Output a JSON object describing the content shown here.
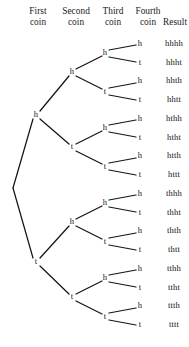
{
  "figure": {
    "background_color": "#ffffff",
    "line_color": "#151515",
    "text_color": "#141414"
  },
  "headers": [
    {
      "id": "first-coin",
      "line1": "First",
      "line2": "coin",
      "x": 38,
      "y": 6
    },
    {
      "id": "second-coin",
      "line1": "Second",
      "line2": "coin",
      "x": 76,
      "y": 6
    },
    {
      "id": "third-coin",
      "line1": "Third",
      "line2": "coin",
      "x": 113,
      "y": 6
    },
    {
      "id": "fourth-coin",
      "line1": "Fourth",
      "line2": "coin",
      "x": 148,
      "y": 6
    },
    {
      "id": "result",
      "line1": "",
      "line2": "Result",
      "x": 175,
      "y": 6
    }
  ],
  "tree": {
    "root": {
      "x": 13,
      "y": 188
    },
    "columns": {
      "first_coin_x": 36,
      "second_coin_x": 72,
      "third_coin_x": 105,
      "fourth_coin_x": 140,
      "result_x": 174
    },
    "leaf_start_y": 44,
    "leaf_spacing": 18.75,
    "nodes": [
      {
        "id": "n-h",
        "label": "h",
        "level": 1,
        "x": 36,
        "y": 115.25
      },
      {
        "id": "n-t",
        "label": "t",
        "level": 1,
        "x": 36,
        "y": 261.75
      },
      {
        "id": "n-hh",
        "label": "h",
        "level": 2,
        "x": 72,
        "y": 72.5
      },
      {
        "id": "n-ht",
        "label": "t",
        "level": 2,
        "x": 72,
        "y": 147.5
      },
      {
        "id": "n-th",
        "label": "h",
        "level": 2,
        "x": 72,
        "y": 222.5
      },
      {
        "id": "n-tt",
        "label": "t",
        "level": 2,
        "x": 72,
        "y": 297.5
      },
      {
        "id": "n-hhh",
        "label": "h",
        "level": 3,
        "x": 105,
        "y": 53.4
      },
      {
        "id": "n-hht",
        "label": "t",
        "level": 3,
        "x": 105,
        "y": 91.6
      },
      {
        "id": "n-hth",
        "label": "h",
        "level": 3,
        "x": 105,
        "y": 128.4
      },
      {
        "id": "n-htt",
        "label": "t",
        "level": 3,
        "x": 105,
        "y": 166.6
      },
      {
        "id": "n-thh",
        "label": "h",
        "level": 3,
        "x": 105,
        "y": 203.4
      },
      {
        "id": "n-tht",
        "label": "t",
        "level": 3,
        "x": 105,
        "y": 241.6
      },
      {
        "id": "n-tth",
        "label": "h",
        "level": 3,
        "x": 105,
        "y": 278.4
      },
      {
        "id": "n-ttt",
        "label": "t",
        "level": 3,
        "x": 105,
        "y": 316.6
      }
    ],
    "leaves": [
      {
        "id": "leaf-hhhh",
        "label": "h",
        "result": "hhhh",
        "x": 140,
        "y": 44.0
      },
      {
        "id": "leaf-hhht",
        "label": "t",
        "result": "hhht",
        "x": 140,
        "y": 62.8
      },
      {
        "id": "leaf-hhth",
        "label": "h",
        "result": "hhth",
        "x": 140,
        "y": 81.5
      },
      {
        "id": "leaf-hhtt",
        "label": "t",
        "result": "hhtt",
        "x": 140,
        "y": 100.3
      },
      {
        "id": "leaf-hthh",
        "label": "h",
        "result": "hthh",
        "x": 140,
        "y": 119.0
      },
      {
        "id": "leaf-htht",
        "label": "t",
        "result": "htht",
        "x": 140,
        "y": 137.8
      },
      {
        "id": "leaf-htth",
        "label": "h",
        "result": "htth",
        "x": 140,
        "y": 156.5
      },
      {
        "id": "leaf-httt",
        "label": "t",
        "result": "httt",
        "x": 140,
        "y": 175.3
      },
      {
        "id": "leaf-thhh",
        "label": "h",
        "result": "thhh",
        "x": 140,
        "y": 194.0
      },
      {
        "id": "leaf-thht",
        "label": "t",
        "result": "thht",
        "x": 140,
        "y": 212.8
      },
      {
        "id": "leaf-thth",
        "label": "h",
        "result": "thth",
        "x": 140,
        "y": 231.5
      },
      {
        "id": "leaf-thtt",
        "label": "t",
        "result": "thtt",
        "x": 140,
        "y": 250.3
      },
      {
        "id": "leaf-tthh",
        "label": "h",
        "result": "tthh",
        "x": 140,
        "y": 269.0
      },
      {
        "id": "leaf-ttht",
        "label": "t",
        "result": "ttht",
        "x": 140,
        "y": 287.8
      },
      {
        "id": "leaf-ttth",
        "label": "h",
        "result": "ttth",
        "x": 140,
        "y": 306.5
      },
      {
        "id": "leaf-tttt",
        "label": "t",
        "result": "tttt",
        "x": 140,
        "y": 325.3
      }
    ],
    "edges": [
      {
        "id": "e-root-h",
        "x1": 13,
        "y1": 188,
        "x2": 33,
        "y2": 119
      },
      {
        "id": "e-root-t",
        "x1": 13,
        "y1": 188,
        "x2": 33,
        "y2": 258
      },
      {
        "id": "e-h-hh",
        "x1": 40,
        "y1": 111,
        "x2": 69,
        "y2": 76
      },
      {
        "id": "e-h-ht",
        "x1": 40,
        "y1": 119,
        "x2": 69,
        "y2": 144
      },
      {
        "id": "e-t-th",
        "x1": 40,
        "y1": 258,
        "x2": 69,
        "y2": 226
      },
      {
        "id": "e-t-tt",
        "x1": 40,
        "y1": 266,
        "x2": 69,
        "y2": 294
      },
      {
        "id": "e-hh-hhh",
        "x1": 76,
        "y1": 69,
        "x2": 102,
        "y2": 56
      },
      {
        "id": "e-hh-hht",
        "x1": 76,
        "y1": 76,
        "x2": 102,
        "y2": 89
      },
      {
        "id": "e-ht-hth",
        "x1": 76,
        "y1": 144,
        "x2": 102,
        "y2": 131
      },
      {
        "id": "e-ht-htt",
        "x1": 76,
        "y1": 151,
        "x2": 102,
        "y2": 164
      },
      {
        "id": "e-th-thh",
        "x1": 76,
        "y1": 219,
        "x2": 102,
        "y2": 206
      },
      {
        "id": "e-th-tht",
        "x1": 76,
        "y1": 226,
        "x2": 102,
        "y2": 239
      },
      {
        "id": "e-tt-tth",
        "x1": 76,
        "y1": 294,
        "x2": 102,
        "y2": 281
      },
      {
        "id": "e-tt-ttt",
        "x1": 76,
        "y1": 301,
        "x2": 102,
        "y2": 314
      },
      {
        "id": "e-hhh-1",
        "x1": 109,
        "y1": 50,
        "x2": 136,
        "y2": 45
      },
      {
        "id": "e-hhh-2",
        "x1": 109,
        "y1": 57,
        "x2": 136,
        "y2": 62
      },
      {
        "id": "e-hht-1",
        "x1": 109,
        "y1": 88,
        "x2": 136,
        "y2": 83
      },
      {
        "id": "e-hht-2",
        "x1": 109,
        "y1": 95,
        "x2": 136,
        "y2": 100
      },
      {
        "id": "e-hth-1",
        "x1": 109,
        "y1": 125,
        "x2": 136,
        "y2": 120
      },
      {
        "id": "e-hth-2",
        "x1": 109,
        "y1": 132,
        "x2": 136,
        "y2": 137
      },
      {
        "id": "e-htt-1",
        "x1": 109,
        "y1": 163,
        "x2": 136,
        "y2": 158
      },
      {
        "id": "e-htt-2",
        "x1": 109,
        "y1": 170,
        "x2": 136,
        "y2": 175
      },
      {
        "id": "e-thh-1",
        "x1": 109,
        "y1": 200,
        "x2": 136,
        "y2": 195
      },
      {
        "id": "e-thh-2",
        "x1": 109,
        "y1": 207,
        "x2": 136,
        "y2": 212
      },
      {
        "id": "e-tht-1",
        "x1": 109,
        "y1": 238,
        "x2": 136,
        "y2": 233
      },
      {
        "id": "e-tht-2",
        "x1": 109,
        "y1": 245,
        "x2": 136,
        "y2": 250
      },
      {
        "id": "e-tth-1",
        "x1": 109,
        "y1": 275,
        "x2": 136,
        "y2": 270
      },
      {
        "id": "e-tth-2",
        "x1": 109,
        "y1": 282,
        "x2": 136,
        "y2": 287
      },
      {
        "id": "e-ttt-1",
        "x1": 109,
        "y1": 313,
        "x2": 136,
        "y2": 308
      },
      {
        "id": "e-ttt-2",
        "x1": 109,
        "y1": 320,
        "x2": 136,
        "y2": 325
      }
    ]
  },
  "chart_data": {
    "type": "diagram",
    "diagram_type": "binary-probability-tree",
    "levels": [
      "First coin",
      "Second coin",
      "Third coin",
      "Fourth coin"
    ],
    "branch_labels": [
      "h",
      "t"
    ],
    "depth": 4,
    "leaf_count": 16,
    "outcomes": [
      "hhhh",
      "hhht",
      "hhth",
      "hhtt",
      "hthh",
      "htht",
      "htth",
      "httt",
      "thhh",
      "thht",
      "thth",
      "thtt",
      "tthh",
      "ttht",
      "ttth",
      "tttt"
    ],
    "result_column_label": "Result"
  }
}
